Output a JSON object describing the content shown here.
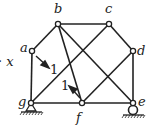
{
  "diagram": {
    "type": "truss",
    "nodes": {
      "a": {
        "label": "a",
        "x": 32,
        "y": 51
      },
      "b": {
        "label": "b",
        "x": 58,
        "y": 24
      },
      "c": {
        "label": "c",
        "x": 109,
        "y": 24
      },
      "d": {
        "label": "d",
        "x": 133,
        "y": 51
      },
      "e": {
        "label": "e",
        "x": 133,
        "y": 103
      },
      "f": {
        "label": "f",
        "x": 82,
        "y": 103
      },
      "g": {
        "label": "g",
        "x": 31,
        "y": 103
      }
    },
    "members": [
      [
        "a",
        "b"
      ],
      [
        "b",
        "c"
      ],
      [
        "c",
        "d"
      ],
      [
        "d",
        "e"
      ],
      [
        "e",
        "f"
      ],
      [
        "f",
        "g"
      ],
      [
        "g",
        "a"
      ],
      [
        "b",
        "f"
      ],
      [
        "b",
        "e"
      ],
      [
        "g",
        "c"
      ],
      [
        "f",
        "d"
      ]
    ],
    "loads": [
      {
        "at": "a",
        "label": "1",
        "direction": "down-right"
      },
      {
        "at": "f",
        "label": "1",
        "direction": "up-left"
      }
    ],
    "supports": {
      "g": "pin",
      "e": "roller"
    },
    "side_label": "· x",
    "colors": {
      "line": "#222222",
      "background": "#ffffff"
    }
  }
}
